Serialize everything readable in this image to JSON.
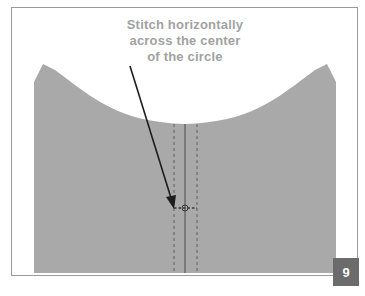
{
  "diagram": {
    "caption": {
      "lines": [
        "Stitch horizontally",
        "across the center",
        "of the circle"
      ]
    },
    "step_badge": {
      "number": "9"
    },
    "colors": {
      "fabric": "#a9a9a9",
      "frame_border": "#9a9a9a",
      "caption_text": "#a2a2a2",
      "badge_bg": "#6b6b6b",
      "arrow": "#1e1e1e",
      "stitch_line": "#5e5e5e"
    },
    "elements": [
      {
        "name": "fabric-panel",
        "description": "gray fabric piece with curved neckline opening"
      },
      {
        "name": "center-fold-line",
        "style": "solid vertical"
      },
      {
        "name": "stitch-guide-lines",
        "style": "dashed vertical, both sides of center"
      },
      {
        "name": "circle-marker",
        "description": "small circle at center with horizontal dashed stitch"
      },
      {
        "name": "pointer-arrow",
        "description": "arrow from caption to circle marker"
      }
    ]
  }
}
